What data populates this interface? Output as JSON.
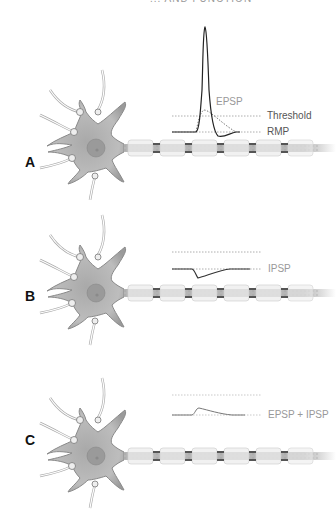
{
  "title": "... AND FUNCTION",
  "panels": [
    {
      "id": "A",
      "label": "A",
      "curve_label": "EPSP",
      "threshold_label": "Threshold",
      "rmp_label": "RMP",
      "description": "EPSP reaches threshold, producing action potential"
    },
    {
      "id": "B",
      "label": "B",
      "curve_label": "IPSP",
      "description": "IPSP hyperpolarizes below resting potential"
    },
    {
      "id": "C",
      "label": "C",
      "curve_label": "EPSP + IPSP",
      "description": "Summed EPSP and IPSP produce small sub-threshold depolarization"
    }
  ],
  "colors": {
    "neuron_fill": "#b8b8b8",
    "neuron_dark": "#6e6e6e",
    "axon": "#c4c4c4",
    "myelin": "#e9e9e9",
    "trace": "#333333",
    "dotted": "#999999",
    "label": "#555555"
  }
}
